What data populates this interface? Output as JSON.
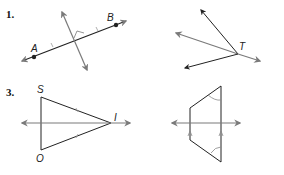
{
  "problems": [
    {
      "number": "1.",
      "points": {
        "a": "A",
        "b": "B"
      },
      "description": "Segment AB with perpendicular bisector"
    },
    {
      "number": "",
      "points": {
        "t": "T"
      },
      "description": "Rays from vertex T"
    },
    {
      "number": "3.",
      "points": {
        "s": "S",
        "i": "I",
        "o": "O"
      },
      "description": "Isosceles triangle SIO with line through I"
    },
    {
      "number": "",
      "points": {},
      "description": "Trapezoid with horizontal line and congruent angle marks"
    }
  ],
  "colors": {
    "dark": "#222222",
    "gray": "#7a7a7a"
  }
}
